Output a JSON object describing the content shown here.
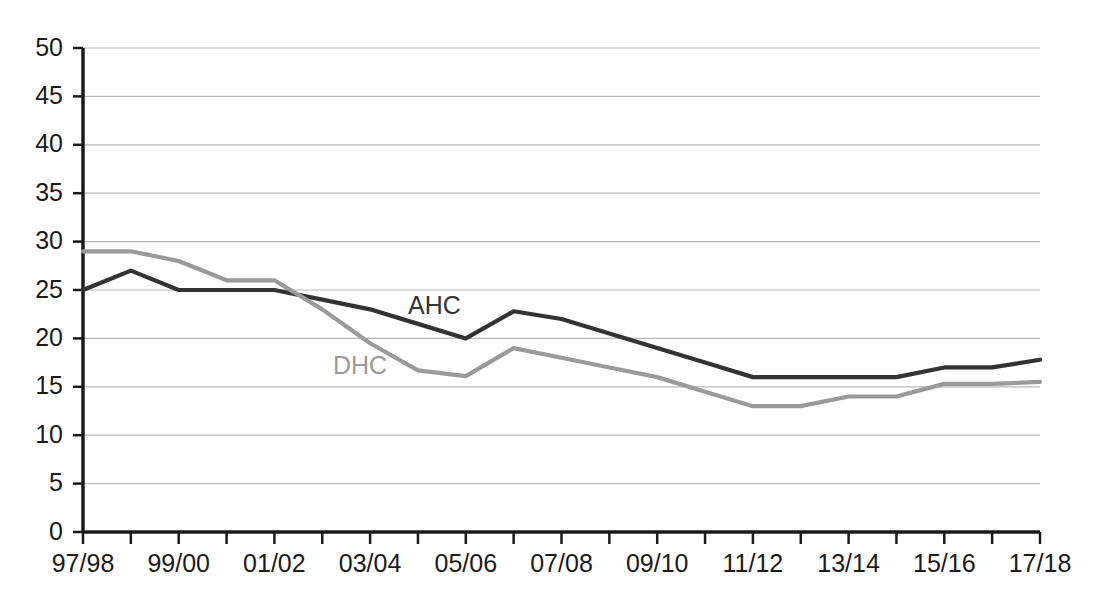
{
  "chart_data": {
    "type": "line",
    "title": "",
    "subtitle": "",
    "xlabel": "",
    "ylabel": "",
    "xlim": [
      0,
      20
    ],
    "ylim": [
      0,
      50
    ],
    "grid": true,
    "grid_axis": "y",
    "legend_position": "inline-labels",
    "categories": [
      "97/98",
      "98/99",
      "99/00",
      "00/01",
      "01/02",
      "02/03",
      "03/04",
      "04/05",
      "05/06",
      "06/07",
      "07/08",
      "08/09",
      "09/10",
      "10/11",
      "11/12",
      "12/13",
      "13/14",
      "14/15",
      "15/16",
      "16/17",
      "17/18"
    ],
    "x_tick_labels_shown": [
      "97/98",
      "99/00",
      "01/02",
      "03/04",
      "05/06",
      "07/08",
      "09/10",
      "11/12",
      "13/14",
      "15/16",
      "17/18"
    ],
    "y_tick_labels": [
      "0",
      "5",
      "10",
      "15",
      "20",
      "25",
      "30",
      "35",
      "40",
      "45",
      "50"
    ],
    "y_ticks": [
      0,
      5,
      10,
      15,
      20,
      25,
      30,
      35,
      40,
      45,
      50
    ],
    "series": [
      {
        "name": "AHC",
        "color": "#333333",
        "label_text": "AHC",
        "values": [
          25,
          27,
          25,
          25,
          25,
          24,
          23,
          21.5,
          20,
          22.8,
          22,
          20.5,
          19,
          17.5,
          16,
          16,
          16,
          16,
          17,
          17,
          17.8
        ]
      },
      {
        "name": "DHC",
        "color": "#9a9a9a",
        "label_text": "DHC",
        "values": [
          29,
          29,
          28,
          26,
          26,
          23,
          19.5,
          16.7,
          16.1,
          19,
          18,
          17,
          16,
          14.5,
          13,
          13,
          14,
          14,
          15.3,
          15.3,
          15.5
        ]
      }
    ]
  },
  "labels": {
    "ahc": "AHC",
    "dhc": "DHC"
  }
}
